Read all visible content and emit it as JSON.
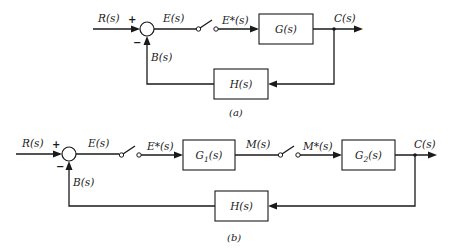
{
  "diagram_a": {
    "caption": "(a)",
    "input": "R(s)",
    "plus_sign": "+",
    "minus_sign": "−",
    "error": "E(s)",
    "sampled_error": "E*(s)",
    "forward_block": "G(s)",
    "output": "C(s)",
    "feedback_signal": "B(s)",
    "feedback_block": "H(s)"
  },
  "diagram_b": {
    "caption": "(b)",
    "input": "R(s)",
    "plus_sign": "+",
    "minus_sign": "−",
    "error": "E(s)",
    "sampled_error": "E*(s)",
    "forward_block_1": "G1(s)",
    "forward_block_1_main": "G",
    "forward_block_1_sub": "1",
    "forward_block_1_arg": "(s)",
    "intermediate": "M(s)",
    "sampled_intermediate": "M*(s)",
    "forward_block_2": "G2(s)",
    "forward_block_2_main": "G",
    "forward_block_2_sub": "2",
    "forward_block_2_arg": "(s)",
    "output": "C(s)",
    "feedback_signal": "B(s)",
    "feedback_block": "H(s)"
  },
  "colors": {
    "line": "#1a1a1a",
    "background": "#ffffff"
  }
}
